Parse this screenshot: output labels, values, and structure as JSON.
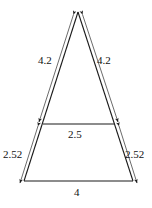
{
  "figure": {
    "type": "geometry-diagram",
    "shape": "isosceles-triangle-with-midsegment",
    "stroke_color": "#1a1a1a",
    "background_color": "#ffffff",
    "labels": {
      "left_leg": "4.2",
      "right_leg": "4.2",
      "midsegment": "2.5",
      "left_lower_leg": "2.52",
      "right_lower_leg": "2.52",
      "base": "4"
    },
    "geometry": {
      "apex": [
        78,
        12
      ],
      "base_left": [
        24,
        181
      ],
      "base_right": [
        133,
        181
      ],
      "mid_left": [
        43,
        124
      ],
      "mid_right": [
        114,
        124
      ]
    }
  }
}
